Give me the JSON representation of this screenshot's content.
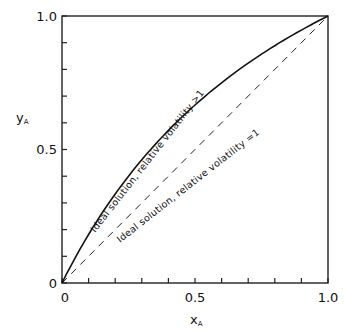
{
  "chart_data": {
    "type": "line",
    "title": "",
    "xlabel": "x_A",
    "ylabel": "y_A",
    "xlim": [
      0,
      1.0
    ],
    "ylim": [
      0,
      1.0
    ],
    "grid": false,
    "x_ticks": [
      0,
      0.1,
      0.2,
      0.3,
      0.4,
      0.5,
      0.6,
      0.7,
      0.8,
      0.9,
      1.0
    ],
    "x_tick_labels": [
      "0",
      "0.5",
      "1.0"
    ],
    "y_ticks": [
      0,
      0.1,
      0.2,
      0.3,
      0.4,
      0.5,
      0.6,
      0.7,
      0.8,
      0.9,
      1.0
    ],
    "y_tick_labels": [
      "0",
      "0.5",
      "1.0"
    ],
    "series": [
      {
        "name": "Ideal solution, relative volatility > 1",
        "style": "solid",
        "relative_volatility": 2.0,
        "x": [
          0,
          0.1,
          0.2,
          0.3,
          0.4,
          0.5,
          0.6,
          0.7,
          0.8,
          0.9,
          1.0
        ],
        "y": [
          0,
          0.18,
          0.33,
          0.46,
          0.57,
          0.67,
          0.75,
          0.82,
          0.89,
          0.95,
          1.0
        ]
      },
      {
        "name": "Ideal solution, relative volatility = 1",
        "style": "dashed",
        "relative_volatility": 1.0,
        "x": [
          0,
          1.0
        ],
        "y": [
          0,
          1.0
        ]
      }
    ],
    "annotations": [
      "Ideal solution, relative volatility >1",
      "Ideal solution, relative volatility =1"
    ]
  },
  "labels": {
    "x_axis_main": "x",
    "x_axis_sub": "A",
    "y_axis_main": "y",
    "y_axis_sub": "A",
    "x_tick_0": "0",
    "x_tick_05": "0.5",
    "x_tick_1": "1.0",
    "y_tick_0": "0",
    "y_tick_05": "0.5",
    "y_tick_1": "1.0",
    "curve_solid": "Ideal solution, relative volatility >1",
    "curve_dashed": "Ideal solution, relative volatility =1"
  }
}
